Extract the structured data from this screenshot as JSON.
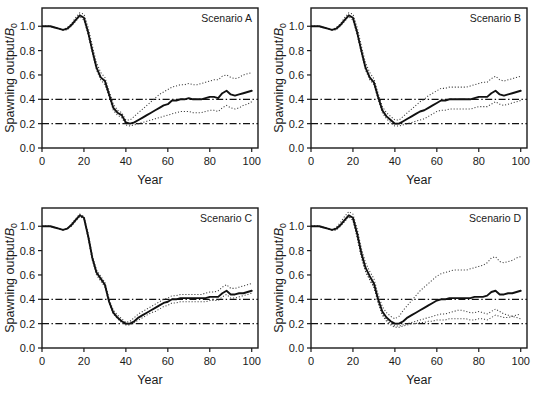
{
  "figure": {
    "panel_count": 4,
    "background_color": "#ffffff",
    "line_color": "#111111",
    "band_color": "#3c3c3c",
    "reference_line_color": "#111111"
  },
  "axes": {
    "ylabel_main": "Spawning output/",
    "ylabel_symbol": "B",
    "ylabel_subscript": "0",
    "xlabel": "Year",
    "xticks": [
      "0",
      "20",
      "40",
      "60",
      "80",
      "100"
    ],
    "yticks": [
      "0.0",
      "0.2",
      "0.4",
      "0.6",
      "0.8",
      "1.0"
    ]
  },
  "chart_data": {
    "type": "line",
    "title": "",
    "xlabel": "Year",
    "ylabel": "Spawning output/B0",
    "xlim": [
      0,
      103
    ],
    "ylim": [
      0.0,
      1.15
    ],
    "xticks": [
      0,
      20,
      40,
      60,
      80,
      100
    ],
    "yticks": [
      0.0,
      0.2,
      0.4,
      0.6,
      0.8,
      1.0
    ],
    "grid": false,
    "legend_position": "none",
    "reference_lines": [
      {
        "value": 0.4,
        "style": "dash-dot",
        "label": "target reference 0.4"
      },
      {
        "value": 0.2,
        "style": "dash-dot",
        "label": "limit reference 0.2"
      }
    ],
    "x": [
      0,
      2,
      4,
      6,
      8,
      10,
      12,
      14,
      16,
      18,
      20,
      22,
      24,
      26,
      28,
      30,
      32,
      34,
      36,
      38,
      40,
      42,
      44,
      46,
      48,
      50,
      52,
      54,
      56,
      58,
      60,
      62,
      64,
      66,
      68,
      70,
      72,
      74,
      76,
      78,
      80,
      82,
      84,
      86,
      88,
      90,
      92,
      94,
      96,
      98,
      100
    ],
    "panels": [
      {
        "id": "A",
        "label": "Scenario A",
        "position": "top-left",
        "series": [
          {
            "name": "median",
            "style": "solid",
            "values": [
              1.0,
              1.0,
              1.0,
              0.99,
              0.98,
              0.97,
              0.98,
              1.01,
              1.05,
              1.09,
              1.07,
              0.95,
              0.8,
              0.66,
              0.58,
              0.55,
              0.44,
              0.33,
              0.29,
              0.27,
              0.21,
              0.2,
              0.21,
              0.23,
              0.25,
              0.27,
              0.29,
              0.31,
              0.33,
              0.35,
              0.36,
              0.39,
              0.39,
              0.4,
              0.4,
              0.41,
              0.4,
              0.4,
              0.4,
              0.41,
              0.42,
              0.42,
              0.41,
              0.45,
              0.47,
              0.44,
              0.43,
              0.44,
              0.45,
              0.46,
              0.47
            ]
          },
          {
            "name": "upper-band",
            "style": "dotted",
            "values": [
              1.0,
              1.0,
              1.0,
              0.99,
              0.98,
              0.97,
              0.99,
              1.02,
              1.07,
              1.11,
              1.1,
              0.99,
              0.84,
              0.7,
              0.62,
              0.58,
              0.47,
              0.36,
              0.31,
              0.29,
              0.23,
              0.23,
              0.26,
              0.29,
              0.32,
              0.35,
              0.38,
              0.41,
              0.44,
              0.46,
              0.48,
              0.5,
              0.51,
              0.52,
              0.52,
              0.53,
              0.52,
              0.52,
              0.53,
              0.54,
              0.55,
              0.56,
              0.56,
              0.59,
              0.6,
              0.58,
              0.57,
              0.58,
              0.6,
              0.61,
              0.62
            ]
          },
          {
            "name": "lower-band",
            "style": "dotted",
            "values": [
              1.0,
              1.0,
              1.0,
              0.99,
              0.98,
              0.97,
              0.97,
              1.0,
              1.04,
              1.08,
              1.05,
              0.93,
              0.78,
              0.64,
              0.56,
              0.52,
              0.42,
              0.31,
              0.27,
              0.25,
              0.19,
              0.18,
              0.19,
              0.2,
              0.21,
              0.22,
              0.23,
              0.24,
              0.25,
              0.26,
              0.27,
              0.28,
              0.29,
              0.3,
              0.3,
              0.3,
              0.29,
              0.29,
              0.29,
              0.3,
              0.31,
              0.31,
              0.3,
              0.33,
              0.35,
              0.33,
              0.32,
              0.33,
              0.35,
              0.36,
              0.38
            ]
          }
        ]
      },
      {
        "id": "B",
        "label": "Scenario B",
        "position": "top-right",
        "series": [
          {
            "name": "median",
            "style": "solid",
            "values": [
              1.0,
              1.0,
              1.0,
              0.99,
              0.98,
              0.97,
              0.98,
              1.01,
              1.05,
              1.09,
              1.07,
              0.95,
              0.8,
              0.66,
              0.58,
              0.54,
              0.42,
              0.31,
              0.26,
              0.23,
              0.2,
              0.2,
              0.22,
              0.24,
              0.26,
              0.28,
              0.3,
              0.31,
              0.33,
              0.35,
              0.37,
              0.39,
              0.39,
              0.4,
              0.4,
              0.4,
              0.4,
              0.4,
              0.4,
              0.41,
              0.42,
              0.42,
              0.42,
              0.45,
              0.47,
              0.44,
              0.43,
              0.44,
              0.45,
              0.46,
              0.47
            ]
          },
          {
            "name": "upper-band",
            "style": "dotted",
            "values": [
              1.0,
              1.0,
              1.0,
              0.99,
              0.98,
              0.97,
              0.99,
              1.02,
              1.07,
              1.11,
              1.1,
              0.99,
              0.84,
              0.7,
              0.62,
              0.57,
              0.45,
              0.34,
              0.29,
              0.26,
              0.23,
              0.23,
              0.26,
              0.29,
              0.32,
              0.35,
              0.38,
              0.4,
              0.43,
              0.45,
              0.47,
              0.49,
              0.49,
              0.5,
              0.5,
              0.5,
              0.5,
              0.5,
              0.51,
              0.52,
              0.53,
              0.54,
              0.54,
              0.57,
              0.59,
              0.56,
              0.55,
              0.56,
              0.57,
              0.58,
              0.59
            ]
          },
          {
            "name": "lower-band",
            "style": "dotted",
            "values": [
              1.0,
              1.0,
              1.0,
              0.99,
              0.98,
              0.97,
              0.97,
              1.0,
              1.04,
              1.08,
              1.05,
              0.93,
              0.78,
              0.64,
              0.56,
              0.52,
              0.4,
              0.29,
              0.24,
              0.21,
              0.18,
              0.18,
              0.19,
              0.2,
              0.21,
              0.22,
              0.23,
              0.24,
              0.26,
              0.28,
              0.3,
              0.31,
              0.31,
              0.32,
              0.32,
              0.32,
              0.32,
              0.32,
              0.32,
              0.33,
              0.34,
              0.34,
              0.34,
              0.36,
              0.38,
              0.36,
              0.35,
              0.36,
              0.37,
              0.38,
              0.39
            ]
          }
        ]
      },
      {
        "id": "C",
        "label": "Scenario C",
        "position": "bottom-left",
        "series": [
          {
            "name": "median",
            "style": "solid",
            "values": [
              1.0,
              1.0,
              1.0,
              0.99,
              0.98,
              0.97,
              0.98,
              1.01,
              1.05,
              1.09,
              1.07,
              0.92,
              0.74,
              0.62,
              0.57,
              0.52,
              0.38,
              0.29,
              0.25,
              0.22,
              0.2,
              0.2,
              0.22,
              0.25,
              0.27,
              0.29,
              0.31,
              0.33,
              0.35,
              0.37,
              0.38,
              0.4,
              0.4,
              0.41,
              0.41,
              0.41,
              0.41,
              0.41,
              0.41,
              0.41,
              0.42,
              0.42,
              0.42,
              0.45,
              0.47,
              0.44,
              0.44,
              0.45,
              0.45,
              0.46,
              0.47
            ]
          },
          {
            "name": "upper-band",
            "style": "dotted",
            "values": [
              1.0,
              1.0,
              1.0,
              0.99,
              0.98,
              0.97,
              0.98,
              1.02,
              1.06,
              1.1,
              1.08,
              0.94,
              0.76,
              0.64,
              0.59,
              0.54,
              0.4,
              0.31,
              0.27,
              0.24,
              0.21,
              0.22,
              0.25,
              0.28,
              0.3,
              0.32,
              0.34,
              0.36,
              0.38,
              0.4,
              0.41,
              0.43,
              0.43,
              0.44,
              0.44,
              0.44,
              0.44,
              0.44,
              0.44,
              0.45,
              0.46,
              0.46,
              0.47,
              0.5,
              0.52,
              0.49,
              0.49,
              0.5,
              0.51,
              0.52,
              0.53
            ]
          },
          {
            "name": "lower-band",
            "style": "dotted",
            "values": [
              1.0,
              1.0,
              1.0,
              0.99,
              0.98,
              0.97,
              0.98,
              1.0,
              1.04,
              1.08,
              1.06,
              0.9,
              0.72,
              0.6,
              0.55,
              0.5,
              0.37,
              0.28,
              0.24,
              0.21,
              0.19,
              0.19,
              0.21,
              0.23,
              0.25,
              0.27,
              0.29,
              0.3,
              0.32,
              0.34,
              0.35,
              0.37,
              0.37,
              0.38,
              0.38,
              0.38,
              0.38,
              0.38,
              0.38,
              0.38,
              0.39,
              0.39,
              0.39,
              0.42,
              0.44,
              0.41,
              0.41,
              0.42,
              0.43,
              0.44,
              0.45
            ]
          }
        ]
      },
      {
        "id": "D",
        "label": "Scenario D",
        "position": "bottom-right",
        "series": [
          {
            "name": "median",
            "style": "solid",
            "values": [
              1.0,
              1.0,
              1.0,
              0.99,
              0.98,
              0.97,
              0.98,
              1.01,
              1.05,
              1.09,
              1.07,
              0.94,
              0.78,
              0.66,
              0.59,
              0.53,
              0.4,
              0.3,
              0.25,
              0.22,
              0.2,
              0.2,
              0.22,
              0.25,
              0.27,
              0.29,
              0.31,
              0.33,
              0.35,
              0.37,
              0.39,
              0.4,
              0.4,
              0.41,
              0.41,
              0.41,
              0.41,
              0.41,
              0.41,
              0.42,
              0.42,
              0.42,
              0.43,
              0.46,
              0.47,
              0.44,
              0.44,
              0.45,
              0.45,
              0.46,
              0.47
            ]
          },
          {
            "name": "upper-band",
            "style": "dotted",
            "values": [
              1.0,
              1.0,
              1.0,
              0.99,
              0.98,
              0.97,
              0.99,
              1.03,
              1.08,
              1.12,
              1.1,
              0.98,
              0.82,
              0.7,
              0.63,
              0.57,
              0.44,
              0.34,
              0.29,
              0.26,
              0.24,
              0.26,
              0.31,
              0.35,
              0.39,
              0.43,
              0.47,
              0.5,
              0.53,
              0.56,
              0.59,
              0.61,
              0.62,
              0.63,
              0.64,
              0.64,
              0.64,
              0.64,
              0.65,
              0.66,
              0.67,
              0.68,
              0.7,
              0.74,
              0.75,
              0.71,
              0.7,
              0.71,
              0.72,
              0.74,
              0.75
            ]
          },
          {
            "name": "lower-band",
            "style": "dotted",
            "values": [
              1.0,
              1.0,
              1.0,
              0.99,
              0.98,
              0.97,
              0.97,
              1.0,
              1.04,
              1.08,
              1.05,
              0.91,
              0.75,
              0.63,
              0.56,
              0.5,
              0.38,
              0.28,
              0.23,
              0.2,
              0.18,
              0.18,
              0.19,
              0.2,
              0.21,
              0.22,
              0.23,
              0.24,
              0.25,
              0.26,
              0.27,
              0.28,
              0.28,
              0.29,
              0.3,
              0.31,
              0.31,
              0.3,
              0.29,
              0.29,
              0.3,
              0.29,
              0.28,
              0.3,
              0.32,
              0.3,
              0.28,
              0.27,
              0.26,
              0.25,
              0.24
            ]
          },
          {
            "name": "lower-band-2",
            "style": "dotted",
            "values": [
              1.0,
              1.0,
              1.0,
              0.99,
              0.98,
              0.97,
              0.97,
              1.0,
              1.04,
              1.08,
              1.05,
              0.91,
              0.75,
              0.63,
              0.56,
              0.5,
              0.37,
              0.27,
              0.22,
              0.19,
              0.17,
              0.17,
              0.18,
              0.19,
              0.2,
              0.2,
              0.21,
              0.21,
              0.22,
              0.22,
              0.23,
              0.23,
              0.23,
              0.24,
              0.24,
              0.24,
              0.24,
              0.24,
              0.23,
              0.23,
              0.24,
              0.24,
              0.23,
              0.25,
              0.27,
              0.26,
              0.25,
              0.25,
              0.26,
              0.27,
              0.28
            ]
          }
        ]
      }
    ]
  }
}
